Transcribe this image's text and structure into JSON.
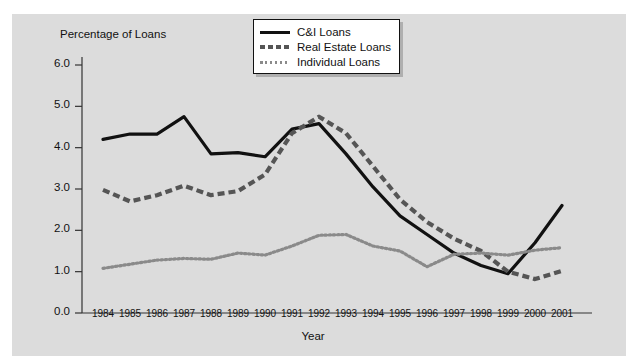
{
  "chart_data": {
    "type": "line",
    "title": "",
    "xlabel": "Year",
    "ylabel": "Percentage of Loans",
    "ylim": [
      0.0,
      6.0
    ],
    "ytick_labels": [
      "0.0",
      "1.0",
      "2.0",
      "3.0",
      "4.0",
      "5.0",
      "6.0"
    ],
    "ytick_values": [
      0.0,
      1.0,
      2.0,
      3.0,
      4.0,
      5.0,
      6.0
    ],
    "grid": false,
    "legend_position": "top-right",
    "categories": [
      "1984",
      "1985",
      "1986",
      "1987",
      "1988",
      "1989",
      "1990",
      "1991",
      "1992",
      "1993",
      "1994",
      "1995",
      "1996",
      "1997",
      "1998",
      "1999",
      "2000",
      "2001"
    ],
    "series": [
      {
        "name": "C&I Loans",
        "style": "solid",
        "color": "#111111",
        "values": [
          4.2,
          4.33,
          4.33,
          4.75,
          3.85,
          3.88,
          3.78,
          4.45,
          4.58,
          3.85,
          3.05,
          2.35,
          1.9,
          1.45,
          1.15,
          0.95,
          1.7,
          2.6
        ]
      },
      {
        "name": "Real Estate Loans",
        "style": "dashed",
        "color": "#555555",
        "values": [
          2.98,
          2.7,
          2.85,
          3.08,
          2.85,
          2.95,
          3.35,
          4.35,
          4.75,
          4.35,
          3.55,
          2.75,
          2.2,
          1.8,
          1.5,
          1.0,
          0.82,
          1.02
        ]
      },
      {
        "name": "Individual Loans",
        "style": "dotted",
        "color": "#8a8a8a",
        "values": [
          1.08,
          1.18,
          1.28,
          1.32,
          1.3,
          1.45,
          1.4,
          1.62,
          1.88,
          1.9,
          1.62,
          1.5,
          1.12,
          1.42,
          1.45,
          1.4,
          1.52,
          1.58
        ]
      }
    ]
  },
  "legend": {
    "items": [
      {
        "label": "C&I Loans"
      },
      {
        "label": "Real Estate Loans"
      },
      {
        "label": "Individual Loans"
      }
    ]
  }
}
